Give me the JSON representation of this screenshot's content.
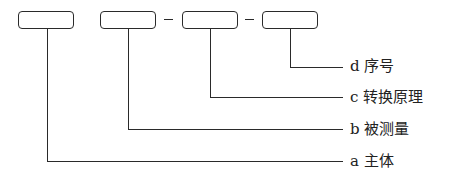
{
  "diagram": {
    "boxes": [
      {
        "id": "a",
        "content": ""
      },
      {
        "id": "b",
        "content": ""
      },
      {
        "id": "c",
        "content": ""
      },
      {
        "id": "d",
        "content": ""
      }
    ],
    "separators": [
      "–",
      "–"
    ],
    "labels": {
      "d": "d 序号",
      "c": "c 转换原理",
      "b": "b 被测量",
      "a": "a 主体"
    }
  }
}
